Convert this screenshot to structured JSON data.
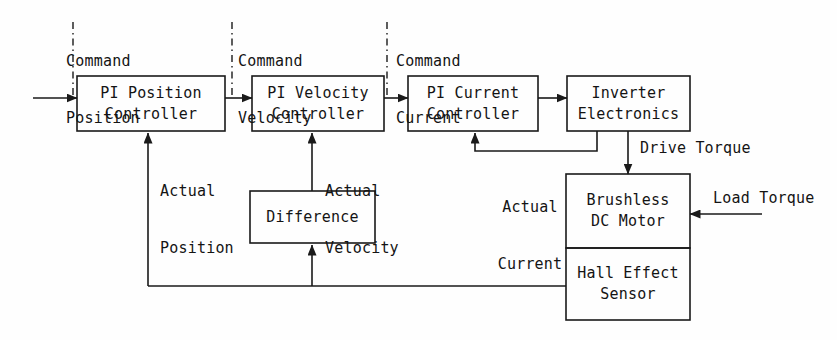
{
  "diagram": {
    "line_color": "#1a1a1a",
    "text_color": "#141414",
    "background_color": "#fefefe"
  },
  "blocks": [
    {
      "id": "pi-position",
      "line1": "PI Position",
      "line2": "Controller"
    },
    {
      "id": "pi-velocity",
      "line1": "PI Velocity",
      "line2": "Controller"
    },
    {
      "id": "pi-current",
      "line1": "PI Current",
      "line2": "Controller"
    },
    {
      "id": "inverter",
      "line1": "Inverter",
      "line2": "Electronics"
    },
    {
      "id": "motor",
      "line1": "Brushless",
      "line2": "DC Motor"
    },
    {
      "id": "hall-sensor",
      "line1": "Hall Effect",
      "line2": "Sensor"
    },
    {
      "id": "difference",
      "line1": "Difference",
      "line2": ""
    }
  ],
  "signals": {
    "command_position": {
      "line1": "Command",
      "line2": "Position"
    },
    "command_velocity": {
      "line1": "Command",
      "line2": "Velocity"
    },
    "command_current": {
      "line1": "Command",
      "line2": "Current"
    },
    "actual_position": {
      "line1": "Actual",
      "line2": "Position"
    },
    "actual_velocity": {
      "line1": "Actual",
      "line2": "Velocity"
    },
    "actual_current": {
      "line1": "Actual",
      "line2": "Current"
    },
    "drive_torque": {
      "text": "Drive Torque"
    },
    "load_torque": {
      "text": "Load Torque"
    }
  }
}
